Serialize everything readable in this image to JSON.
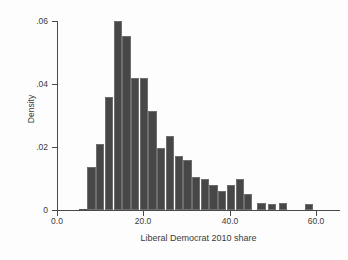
{
  "figure": {
    "title": "",
    "y_axis_title": "Density",
    "x_axis_title": "Liberal Democrat 2010 share",
    "bar_color": "#474747",
    "axis_color": "#4a4a4a",
    "background": "#fdfdfd"
  },
  "axes": {
    "x_ticks": [
      "0.0",
      "20.0",
      "40.0",
      "60.0"
    ],
    "x_tick_values": [
      0,
      20,
      40,
      60
    ],
    "y_ticks": [
      "0",
      ".02",
      ".04",
      ".06"
    ],
    "y_tick_values": [
      0,
      0.02,
      0.04,
      0.06
    ]
  },
  "chart_data": {
    "type": "bar",
    "title": "",
    "subtitle": "",
    "xlabel": "Liberal Democrat 2010 share",
    "ylabel": "Density",
    "xlim": [
      0,
      65
    ],
    "ylim": [
      0,
      0.06
    ],
    "grid": false,
    "legend": null,
    "bin_width": 2,
    "categories": [
      4,
      6,
      8,
      10,
      12,
      14,
      16,
      18,
      20,
      22,
      24,
      26,
      28,
      30,
      32,
      34,
      36,
      38,
      40,
      42,
      44,
      46,
      48,
      50,
      52,
      54,
      56,
      58,
      60
    ],
    "values": [
      0.0004,
      0.0135,
      0.021,
      0.036,
      0.0601,
      0.0552,
      0.0418,
      0.0418,
      0.0314,
      0.0197,
      0.0235,
      0.017,
      0.0158,
      0.0105,
      0.0098,
      0.008,
      0.006,
      0.008,
      0.0098,
      0.005,
      0.0,
      0.0022,
      0.0018,
      0.0022,
      0.0,
      0.0018,
      0.0,
      0.0,
      0.0
    ],
    "series": [
      {
        "name": "Density",
        "values": [
          0.0004,
          0.0135,
          0.021,
          0.036,
          0.0601,
          0.0552,
          0.0418,
          0.0418,
          0.0314,
          0.0197,
          0.0235,
          0.017,
          0.0158,
          0.0105,
          0.0098,
          0.008,
          0.006,
          0.008,
          0.0098,
          0.005,
          0.0,
          0.0022,
          0.0018,
          0.0022,
          0.0,
          0.0018,
          0.0,
          0.0,
          0.0
        ]
      }
    ],
    "bars": [
      {
        "x0": 5.0,
        "x1": 6.9,
        "value": 0.0004
      },
      {
        "x0": 7.0,
        "x1": 8.9,
        "value": 0.0135
      },
      {
        "x0": 9.0,
        "x1": 10.9,
        "value": 0.021
      },
      {
        "x0": 11.0,
        "x1": 12.9,
        "value": 0.036
      },
      {
        "x0": 13.0,
        "x1": 14.9,
        "value": 0.0601
      },
      {
        "x0": 15.0,
        "x1": 16.9,
        "value": 0.0552
      },
      {
        "x0": 17.0,
        "x1": 18.9,
        "value": 0.0418
      },
      {
        "x0": 19.0,
        "x1": 20.9,
        "value": 0.0418
      },
      {
        "x0": 21.0,
        "x1": 22.9,
        "value": 0.0314
      },
      {
        "x0": 23.0,
        "x1": 24.9,
        "value": 0.0197
      },
      {
        "x0": 25.0,
        "x1": 26.9,
        "value": 0.0235
      },
      {
        "x0": 27.0,
        "x1": 28.9,
        "value": 0.017
      },
      {
        "x0": 29.0,
        "x1": 30.9,
        "value": 0.0158
      },
      {
        "x0": 31.0,
        "x1": 32.9,
        "value": 0.0105
      },
      {
        "x0": 33.0,
        "x1": 34.9,
        "value": 0.0098
      },
      {
        "x0": 35.0,
        "x1": 36.9,
        "value": 0.008
      },
      {
        "x0": 37.0,
        "x1": 38.9,
        "value": 0.006
      },
      {
        "x0": 39.0,
        "x1": 40.9,
        "value": 0.008
      },
      {
        "x0": 41.0,
        "x1": 42.9,
        "value": 0.0098
      },
      {
        "x0": 43.0,
        "x1": 44.9,
        "value": 0.005
      },
      {
        "x0": 46.0,
        "x1": 47.9,
        "value": 0.0022
      },
      {
        "x0": 48.5,
        "x1": 50.4,
        "value": 0.0018
      },
      {
        "x0": 51.0,
        "x1": 52.9,
        "value": 0.0022
      },
      {
        "x0": 57.0,
        "x1": 58.9,
        "value": 0.0018
      }
    ]
  }
}
